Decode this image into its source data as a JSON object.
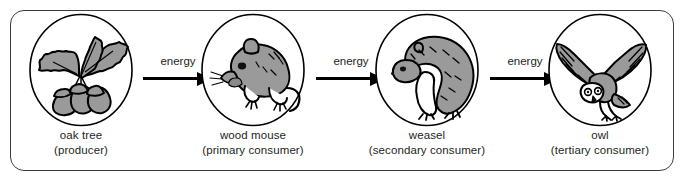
{
  "diagram": {
    "type": "food-chain",
    "title": "",
    "frame": {
      "border_color": "#3d3d3d",
      "background": "#ffffff"
    },
    "palette": {
      "fill_gray": "#9a9a9a",
      "outline": "#000000",
      "text": "#231f20",
      "white": "#ffffff"
    },
    "stages": [
      {
        "id": "oak-tree",
        "icon": "oak-tree-icon",
        "name": "oak tree",
        "role": "(producer)"
      },
      {
        "id": "wood-mouse",
        "icon": "wood-mouse-icon",
        "name": "wood mouse",
        "role": "(primary consumer)"
      },
      {
        "id": "weasel",
        "icon": "weasel-icon",
        "name": "weasel",
        "role": "(secondary consumer)"
      },
      {
        "id": "owl",
        "icon": "owl-icon",
        "name": "owl",
        "role": "(tertiary consumer)"
      }
    ],
    "arrows": [
      {
        "id": "arrow-1",
        "label": "energy",
        "from": "oak-tree",
        "to": "wood-mouse"
      },
      {
        "id": "arrow-2",
        "label": "energy",
        "from": "wood-mouse",
        "to": "weasel"
      },
      {
        "id": "arrow-3",
        "label": "energy",
        "from": "weasel",
        "to": "owl"
      }
    ]
  }
}
